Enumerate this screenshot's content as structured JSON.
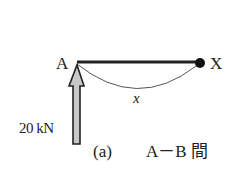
{
  "diagram": {
    "point_a_label": "A",
    "point_x_label": "X",
    "distance_label": "x",
    "force_label": "20 kN",
    "caption": {
      "part": "(a)",
      "text": "A－B 間"
    }
  }
}
